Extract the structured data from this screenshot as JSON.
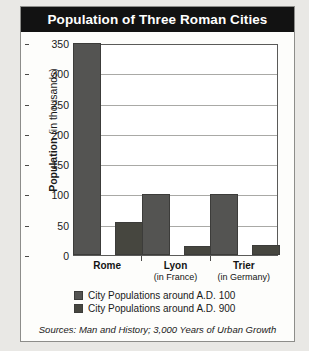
{
  "chart_data": {
    "type": "bar",
    "title": "Population of Three Roman Cities",
    "xlabel": "",
    "ylabel": "Population (in thousands)",
    "ylabel_bold_part": "Population",
    "ylabel_light_part": " (in thousands)",
    "ylim": [
      0,
      350
    ],
    "yticks": [
      350,
      300,
      250,
      200,
      150,
      100,
      50,
      0
    ],
    "grid": true,
    "legend_position": "bottom-left",
    "categories": [
      "Rome",
      "Lyon",
      "Trier"
    ],
    "category_sublabels": [
      "",
      "(in France)",
      "(in Germany)"
    ],
    "series": [
      {
        "name": "City Populations around A.D. 100",
        "values": [
          350,
          100,
          100
        ],
        "color": "#545452"
      },
      {
        "name": "City Populations around A.D. 900",
        "values": [
          55,
          15,
          17
        ],
        "color": "#46463f"
      }
    ],
    "source_note": "Sources: Man and History; 3,000 Years of Urban Growth"
  },
  "chart": {
    "title": "Population of Three Roman Cities",
    "y_axis_title_bold": "Population",
    "y_axis_title_light": " (in thousands)",
    "y_ticks": [
      "350",
      "300",
      "250",
      "200",
      "150",
      "100",
      "50",
      "0"
    ],
    "categories": [
      {
        "name": "Rome",
        "sub": ""
      },
      {
        "name": "Lyon",
        "sub": "(in France)"
      },
      {
        "name": "Trier",
        "sub": "(in Germany)"
      }
    ],
    "legend": [
      {
        "label": "City Populations around A.D. 100"
      },
      {
        "label": "City Populations around A.D. 900"
      }
    ],
    "source": "Sources: Man and History; 3,000 Years of Urban Growth"
  }
}
